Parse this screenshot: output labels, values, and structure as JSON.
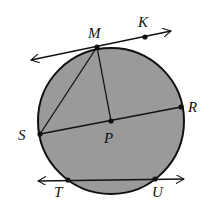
{
  "diagram": {
    "type": "circle-geometry",
    "fill_color": "#9a9a9a",
    "stroke_color": "#111111",
    "circle": {
      "center": "P",
      "cx": 111,
      "cy": 121,
      "r": 73
    },
    "points": [
      {
        "name": "M",
        "x": 97,
        "y": 47,
        "label_x": 88,
        "label_y": 38
      },
      {
        "name": "K",
        "x": 145,
        "y": 37,
        "label_x": 138,
        "label_y": 27
      },
      {
        "name": "R",
        "x": 181,
        "y": 107,
        "label_x": 188,
        "label_y": 112
      },
      {
        "name": "S",
        "x": 40,
        "y": 134,
        "label_x": 18,
        "label_y": 140
      },
      {
        "name": "P",
        "x": 111,
        "y": 121,
        "label_x": 104,
        "label_y": 143
      },
      {
        "name": "T",
        "x": 68,
        "y": 180,
        "label_x": 54,
        "label_y": 197
      },
      {
        "name": "U",
        "x": 155,
        "y": 179,
        "label_x": 152,
        "label_y": 197
      }
    ],
    "labels": {
      "M": "M",
      "K": "K",
      "R": "R",
      "S": "S",
      "P": "P",
      "T": "T",
      "U": "U"
    },
    "segments": [
      {
        "from": "M",
        "to": "S",
        "kind": "chord"
      },
      {
        "from": "M",
        "to": "P",
        "kind": "radius"
      },
      {
        "from": "S",
        "to": "R",
        "kind": "diameter"
      }
    ],
    "lines": [
      {
        "through": [
          "M",
          "K"
        ],
        "kind": "tangent",
        "x1": 31,
        "y1": 60,
        "x2": 171,
        "y2": 31
      },
      {
        "through": [
          "T",
          "U"
        ],
        "kind": "secant",
        "x1": 38,
        "y1": 181,
        "x2": 184,
        "y2": 179
      }
    ]
  }
}
